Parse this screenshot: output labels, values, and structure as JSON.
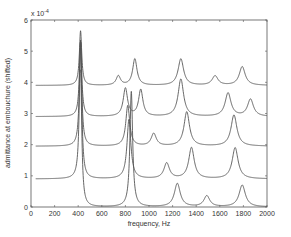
{
  "chart_data": {
    "type": "line",
    "title": "",
    "xlabel": "frequency, Hz",
    "ylabel": "admittance at embouchure (shifted)",
    "y_multiplier": "x 10",
    "y_multiplier_exp": "-4",
    "xlim": [
      0,
      2000
    ],
    "ylim": [
      0,
      6
    ],
    "xticks": [
      0,
      200,
      400,
      600,
      800,
      1000,
      1200,
      1400,
      1600,
      1800,
      2000
    ],
    "yticks": [
      0,
      1,
      2,
      3,
      4,
      5,
      6
    ],
    "grid": false,
    "legend": null,
    "line_color": "#555555",
    "series": [
      {
        "name": "trace-1",
        "baseline": 0.0,
        "start_x": 420,
        "peaks": [
          {
            "f": 420,
            "h": 4.4,
            "w": 12
          },
          {
            "f": 850,
            "h": 3.7,
            "w": 14
          },
          {
            "f": 1240,
            "h": 0.75,
            "w": 30
          },
          {
            "f": 1490,
            "h": 0.35,
            "w": 30
          },
          {
            "f": 1790,
            "h": 0.7,
            "w": 32
          }
        ]
      },
      {
        "name": "trace-2",
        "baseline": 0.9,
        "start_x": 40,
        "peaks": [
          {
            "f": 420,
            "h": 4.4,
            "w": 12
          },
          {
            "f": 830,
            "h": 1.9,
            "w": 20
          },
          {
            "f": 1150,
            "h": 0.5,
            "w": 28
          },
          {
            "f": 1360,
            "h": 1.0,
            "w": 28
          },
          {
            "f": 1730,
            "h": 1.0,
            "w": 30
          }
        ]
      },
      {
        "name": "trace-3",
        "baseline": 1.95,
        "start_x": 40,
        "peaks": [
          {
            "f": 420,
            "h": 3.4,
            "w": 12
          },
          {
            "f": 820,
            "h": 1.3,
            "w": 20
          },
          {
            "f": 1040,
            "h": 0.4,
            "w": 26
          },
          {
            "f": 1320,
            "h": 1.1,
            "w": 28
          },
          {
            "f": 1720,
            "h": 1.0,
            "w": 30
          }
        ]
      },
      {
        "name": "trace-4",
        "baseline": 2.9,
        "start_x": 40,
        "peaks": [
          {
            "f": 420,
            "h": 2.4,
            "w": 12
          },
          {
            "f": 800,
            "h": 0.9,
            "w": 22
          },
          {
            "f": 930,
            "h": 0.85,
            "w": 22
          },
          {
            "f": 1270,
            "h": 1.2,
            "w": 28
          },
          {
            "f": 1670,
            "h": 0.75,
            "w": 30
          },
          {
            "f": 1860,
            "h": 0.55,
            "w": 30
          }
        ]
      },
      {
        "name": "trace-5",
        "baseline": 3.9,
        "start_x": 40,
        "peaks": [
          {
            "f": 420,
            "h": 1.75,
            "w": 12
          },
          {
            "f": 740,
            "h": 0.3,
            "w": 22
          },
          {
            "f": 880,
            "h": 0.85,
            "w": 22
          },
          {
            "f": 1270,
            "h": 0.85,
            "w": 28
          },
          {
            "f": 1560,
            "h": 0.3,
            "w": 30
          },
          {
            "f": 1790,
            "h": 0.6,
            "w": 30
          }
        ]
      }
    ]
  },
  "labels": {
    "xlabel": "frequency, Hz",
    "ylabel": "admittance at embouchure (shifted)",
    "multiplier_base": "x 10",
    "multiplier_exp": "-4"
  }
}
